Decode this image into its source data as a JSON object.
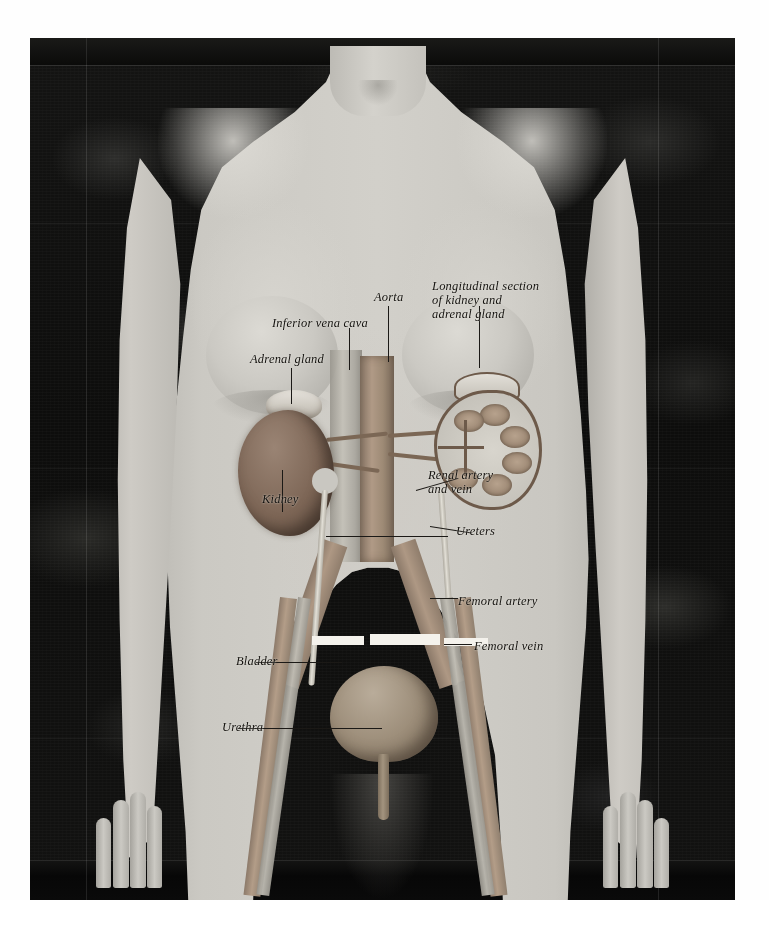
{
  "plate": {
    "title": "Anatomical illustration of the female urinary system overlaid on a torso photograph",
    "subject": "female torso, frontal view",
    "background_color": "#0d0d0c",
    "skin_color": "#c9c7c1",
    "organ_color": "#7d6656"
  },
  "labels": [
    {
      "id": "inferior-vena-cava",
      "text": "Inferior vena cava",
      "x": 272,
      "y": 316
    },
    {
      "id": "aorta",
      "text": "Aorta",
      "x": 374,
      "y": 290
    },
    {
      "id": "longitudinal-section",
      "text": "Longitudinal section\nof kidney and\nadrenal gland",
      "x": 432,
      "y": 279
    },
    {
      "id": "adrenal-gland",
      "text": "Adrenal gland",
      "x": 250,
      "y": 352
    },
    {
      "id": "kidney",
      "text": "Kidney",
      "x": 262,
      "y": 492
    },
    {
      "id": "renal-artery-vein",
      "text": "Renal artery\nand vein",
      "x": 428,
      "y": 468
    },
    {
      "id": "ureters",
      "text": "Ureters",
      "x": 456,
      "y": 524
    },
    {
      "id": "femoral-artery",
      "text": "Femoral artery",
      "x": 458,
      "y": 594
    },
    {
      "id": "femoral-vein",
      "text": "Femoral vein",
      "x": 474,
      "y": 639
    },
    {
      "id": "bladder",
      "text": "Bladder",
      "x": 236,
      "y": 654
    },
    {
      "id": "urethra",
      "text": "Urethra",
      "x": 222,
      "y": 720
    }
  ],
  "structures": [
    {
      "id": "aorta",
      "name": "Aorta"
    },
    {
      "id": "inferior-vena-cava",
      "name": "Inferior vena cava"
    },
    {
      "id": "kidney-whole",
      "name": "Kidney"
    },
    {
      "id": "adrenal-gland",
      "name": "Adrenal gland"
    },
    {
      "id": "kidney-section",
      "name": "Longitudinal section of kidney and adrenal gland"
    },
    {
      "id": "renal-vessels",
      "name": "Renal artery and vein"
    },
    {
      "id": "ureters",
      "name": "Ureters"
    },
    {
      "id": "bladder",
      "name": "Bladder"
    },
    {
      "id": "urethra",
      "name": "Urethra"
    },
    {
      "id": "femoral-artery",
      "name": "Femoral artery"
    },
    {
      "id": "femoral-vein",
      "name": "Femoral vein"
    }
  ]
}
